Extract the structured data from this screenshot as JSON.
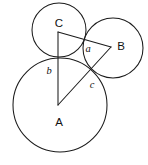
{
  "figure": {
    "background_color": "#ffffff",
    "stroke_color": "#1b1b1b",
    "width": 148,
    "height": 165,
    "circles": [
      {
        "id": "circle-a",
        "label": "A",
        "cx": 60,
        "cy": 105,
        "r": 47,
        "label_x": 59,
        "label_y": 122
      },
      {
        "id": "circle-b",
        "label": "B",
        "cx": 113,
        "cy": 48,
        "r": 30,
        "label_x": 121,
        "label_y": 46
      },
      {
        "id": "circle-c",
        "label": "C",
        "cx": 59,
        "cy": 30,
        "r": 27,
        "label_x": 59,
        "label_y": 23
      }
    ],
    "triangle": {
      "vertex_a": {
        "x": 58,
        "y": 105
      },
      "vertex_b": {
        "x": 111,
        "y": 47
      },
      "vertex_c": {
        "x": 58,
        "y": 32
      },
      "sides": [
        {
          "id": "side-a",
          "label": "a",
          "from": "C",
          "to": "B",
          "label_x": 88,
          "label_y": 48
        },
        {
          "id": "side-b",
          "label": "b",
          "from": "C",
          "to": "A",
          "label_x": 49,
          "label_y": 70
        },
        {
          "id": "side-c",
          "label": "c",
          "from": "A",
          "to": "B",
          "label_x": 92,
          "label_y": 84
        }
      ]
    }
  }
}
